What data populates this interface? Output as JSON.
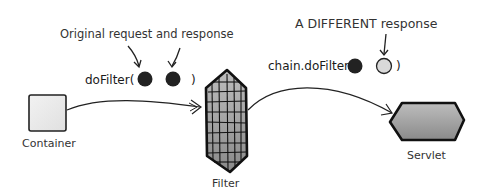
{
  "annotations": {
    "original": "Original request and response",
    "different": "A DIFFERENT response"
  },
  "calls": {
    "dofilter_open": "doFilter(",
    "dofilter_close": ")",
    "chain_open": "chain.doFilter(",
    "chain_close": ")"
  },
  "nodes": {
    "container": "Container",
    "filter": "Filter",
    "servlet": "Servlet"
  },
  "colors": {
    "dark_circle": "#222222",
    "light_circle": "#d9d9d9",
    "shape_fill": "#9a9a9a",
    "outline": "#1a1a1a"
  }
}
